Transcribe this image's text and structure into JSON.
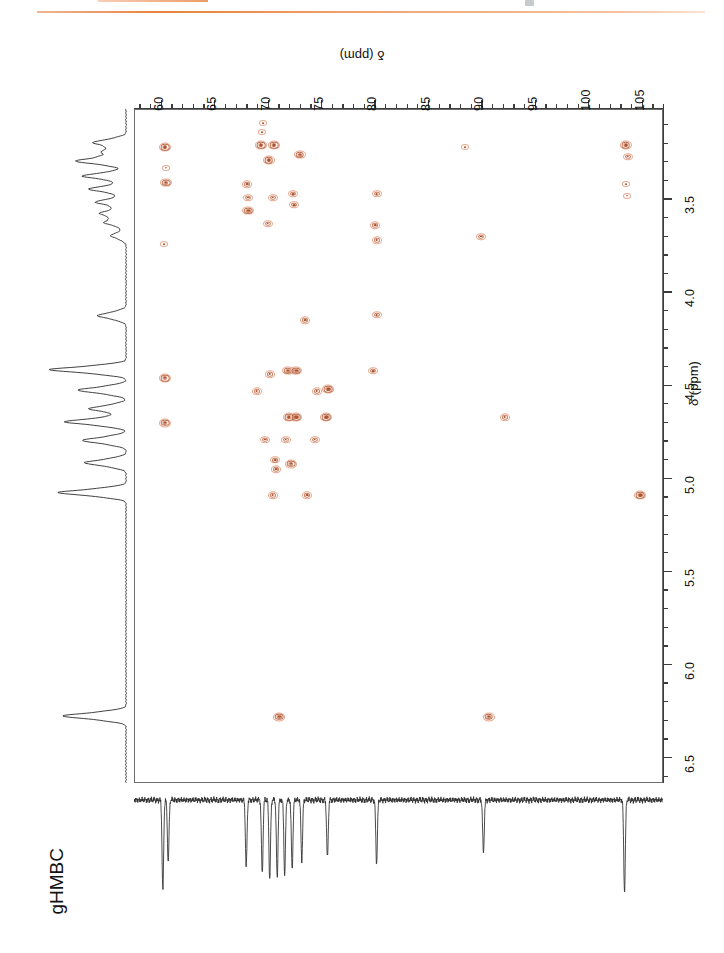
{
  "experiment": {
    "label": "gHMBC",
    "type": "2D NMR HMBC spectrum"
  },
  "decorations": {
    "top_rule_color": "#e8823c",
    "contour_color": "#b0522c",
    "contour_color_light": "#e5a98e",
    "axis_color": "#3c3c3c"
  },
  "carbon_axis": {
    "title": "δ (ppm)",
    "nucleus": "13C",
    "orientation": "top",
    "direction": "left-to-right increasing",
    "range": [
      57.5,
      107.0
    ],
    "major_ticks": [
      60,
      65,
      70,
      75,
      80,
      85,
      90,
      95,
      100,
      105
    ],
    "tick_labels": [
      "60",
      "65",
      "70",
      "75",
      "80",
      "85",
      "90",
      "95",
      "100",
      "105"
    ],
    "minor_tick_step": 1
  },
  "proton_axis": {
    "title": "δ (ppm)",
    "nucleus": "1H",
    "orientation": "right",
    "direction": "top-to-bottom increasing",
    "range": [
      3.02,
      6.64
    ],
    "major_ticks": [
      3.5,
      4.0,
      4.5,
      5.0,
      5.5,
      6.0,
      6.5
    ],
    "tick_labels": [
      "3.5",
      "4.0",
      "4.5",
      "5.0",
      "5.5",
      "6.0",
      "6.5"
    ],
    "minor_tick_step": 0.1
  },
  "chart_data": {
    "type": "scatter",
    "title": "gHMBC",
    "xlabel": "δ (ppm)",
    "ylabel": "δ (ppm)",
    "xlim": [
      57.5,
      107.0
    ],
    "ylim": [
      6.64,
      3.02
    ],
    "grid": false,
    "legend": "none",
    "x_axis_position": "top",
    "y_axis_position": "right",
    "series": [
      {
        "name": "HMBC cross peaks",
        "color": "#b0522c",
        "points": [
          {
            "c": 60.3,
            "h": 3.22,
            "i": 3
          },
          {
            "c": 60.4,
            "h": 3.41,
            "i": 3
          },
          {
            "c": 60.4,
            "h": 3.33,
            "i": 1
          },
          {
            "c": 60.2,
            "h": 3.74,
            "i": 1
          },
          {
            "c": 60.3,
            "h": 4.46,
            "i": 3
          },
          {
            "c": 60.3,
            "h": 4.7,
            "i": 3
          },
          {
            "c": 69.5,
            "h": 3.09,
            "i": 1
          },
          {
            "c": 69.4,
            "h": 3.14,
            "i": 1
          },
          {
            "c": 69.3,
            "h": 3.21,
            "i": 3
          },
          {
            "c": 70.5,
            "h": 3.21,
            "i": 3
          },
          {
            "c": 70.0,
            "h": 3.29,
            "i": 3
          },
          {
            "c": 72.9,
            "h": 3.26,
            "i": 3
          },
          {
            "c": 68.0,
            "h": 3.42,
            "i": 2
          },
          {
            "c": 68.1,
            "h": 3.49,
            "i": 2
          },
          {
            "c": 68.1,
            "h": 3.56,
            "i": 3
          },
          {
            "c": 70.4,
            "h": 3.49,
            "i": 2
          },
          {
            "c": 69.9,
            "h": 3.63,
            "i": 2
          },
          {
            "c": 72.3,
            "h": 3.47,
            "i": 2
          },
          {
            "c": 72.4,
            "h": 3.53,
            "i": 2
          },
          {
            "c": 80.1,
            "h": 3.47,
            "i": 2
          },
          {
            "c": 80.0,
            "h": 3.64,
            "i": 2
          },
          {
            "c": 80.1,
            "h": 3.72,
            "i": 2
          },
          {
            "c": 89.9,
            "h": 3.7,
            "i": 2
          },
          {
            "c": 103.4,
            "h": 3.21,
            "i": 3
          },
          {
            "c": 103.6,
            "h": 3.27,
            "i": 2
          },
          {
            "c": 103.4,
            "h": 3.42,
            "i": 1
          },
          {
            "c": 103.5,
            "h": 3.48,
            "i": 1
          },
          {
            "c": 73.4,
            "h": 4.15,
            "i": 2
          },
          {
            "c": 80.1,
            "h": 4.12,
            "i": 2
          },
          {
            "c": 70.1,
            "h": 4.44,
            "i": 2
          },
          {
            "c": 71.8,
            "h": 4.42,
            "i": 3
          },
          {
            "c": 72.6,
            "h": 4.42,
            "i": 3
          },
          {
            "c": 79.8,
            "h": 4.42,
            "i": 2
          },
          {
            "c": 68.9,
            "h": 4.53,
            "i": 2
          },
          {
            "c": 74.5,
            "h": 4.53,
            "i": 2
          },
          {
            "c": 75.6,
            "h": 4.52,
            "i": 3
          },
          {
            "c": 71.9,
            "h": 4.67,
            "i": 3
          },
          {
            "c": 72.6,
            "h": 4.67,
            "i": 3
          },
          {
            "c": 75.4,
            "h": 4.67,
            "i": 3
          },
          {
            "c": 92.1,
            "h": 4.67,
            "i": 2
          },
          {
            "c": 69.7,
            "h": 4.79,
            "i": 2
          },
          {
            "c": 71.6,
            "h": 4.79,
            "i": 2
          },
          {
            "c": 74.3,
            "h": 4.79,
            "i": 2
          },
          {
            "c": 70.6,
            "h": 4.9,
            "i": 2
          },
          {
            "c": 70.7,
            "h": 4.95,
            "i": 2
          },
          {
            "c": 72.1,
            "h": 4.92,
            "i": 3
          },
          {
            "c": 70.4,
            "h": 5.09,
            "i": 2
          },
          {
            "c": 73.6,
            "h": 5.09,
            "i": 2
          },
          {
            "c": 71.0,
            "h": 6.28,
            "i": 3
          },
          {
            "c": 90.6,
            "h": 6.28,
            "i": 3
          },
          {
            "c": 88.4,
            "h": 3.22,
            "i": 1
          },
          {
            "c": 104.8,
            "h": 5.09,
            "i": 3
          }
        ]
      }
    ],
    "projections": {
      "proton_1d": {
        "position": "left",
        "nucleus": "1H",
        "peaks_ppm": [
          3.2,
          3.25,
          3.3,
          3.38,
          3.45,
          3.52,
          3.58,
          3.63,
          3.7,
          4.13,
          4.42,
          4.53,
          4.63,
          4.7,
          4.8,
          4.92,
          5.08,
          6.28
        ]
      },
      "carbon_1d": {
        "position": "bottom",
        "nucleus": "13C",
        "direction": "negative (downward) peaks",
        "peaks_ppm": [
          60.2,
          60.7,
          68.0,
          69.5,
          70.2,
          70.9,
          71.6,
          72.3,
          73.2,
          75.6,
          80.2,
          90.2,
          103.4
        ]
      }
    }
  }
}
